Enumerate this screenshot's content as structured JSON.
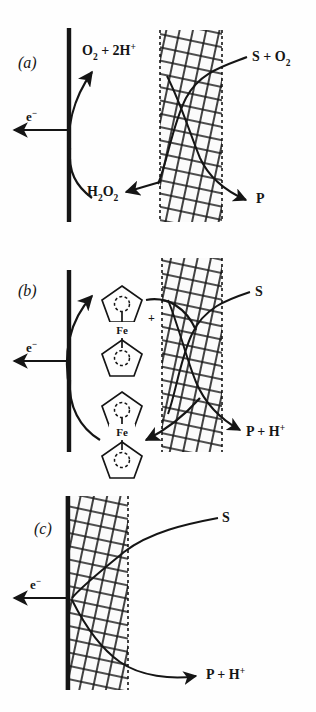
{
  "figure": {
    "background_color": "#fefefe",
    "ink_color": "#151515",
    "width": 316,
    "height": 712
  },
  "panels": [
    {
      "id": "a",
      "label": "(a)",
      "description": "First-generation oxygen-mediated enzyme electrode",
      "electrode_label": "e−",
      "electrode_symbol": "e",
      "electrode_superscript": "−",
      "membrane": {
        "name": "cross-hatched enzyme membrane",
        "left": 160,
        "right": 222,
        "top": 30,
        "bottom": 222
      },
      "labels": [
        {
          "name": "oxygen-proton-label",
          "text": "O₂ + 2H⁺",
          "x": 82,
          "y": 55
        },
        {
          "name": "substrate-oxygen-label",
          "text": "S + O₂",
          "x": 252,
          "y": 60
        },
        {
          "name": "hydrogen-peroxide-label",
          "text": "H₂O₂",
          "x": 87,
          "y": 192
        },
        {
          "name": "product-label",
          "text": "P",
          "x": 258,
          "y": 198
        }
      ]
    },
    {
      "id": "b",
      "label": "(b)",
      "description": "Second-generation ferrocene-mediated enzyme electrode",
      "electrode_label": "e−",
      "electrode_symbol": "e",
      "electrode_superscript": "−",
      "membrane": {
        "name": "cross-hatched enzyme membrane",
        "left": 162,
        "right": 222,
        "top": 258,
        "bottom": 452
      },
      "mediator": {
        "name": "ferrocene",
        "metal_label": "Fe",
        "oxidized_charge": "+",
        "oxidized_name": "ferrocenium-cation",
        "reduced_name": "ferrocene-neutral"
      },
      "labels": [
        {
          "name": "substrate-label",
          "text": "S",
          "x": 255,
          "y": 294
        },
        {
          "name": "product-proton-label",
          "text": "P + H⁺",
          "x": 248,
          "y": 432
        }
      ]
    },
    {
      "id": "c",
      "label": "(c)",
      "description": "Third-generation direct-transfer enzyme electrode",
      "electrode_label": "e−",
      "electrode_symbol": "e",
      "electrode_superscript": "−",
      "membrane": {
        "name": "cross-hatched enzyme membrane",
        "left": 68,
        "right": 128,
        "top": 496,
        "bottom": 690
      },
      "labels": [
        {
          "name": "substrate-label",
          "text": "S",
          "x": 222,
          "y": 521
        },
        {
          "name": "product-proton-label",
          "text": "P + H⁺",
          "x": 208,
          "y": 674
        }
      ]
    }
  ]
}
